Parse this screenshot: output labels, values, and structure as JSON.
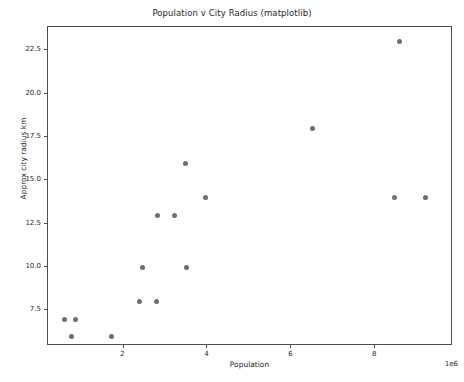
{
  "figure": {
    "title": "Population v City Radius (matplotlib)",
    "background": "#ffffff",
    "frame_color": "#4d4d4d",
    "marker_color": "#6e6e6e"
  },
  "axes": {
    "x_label": "Population",
    "y_label": "Approx city radius km",
    "x_offset_text": "1e6",
    "x_ticks": [
      "2",
      "4",
      "6",
      "8"
    ],
    "y_ticks": [
      "7.5",
      "10.0",
      "12.5",
      "15.0",
      "17.5",
      "20.0",
      "22.5"
    ]
  },
  "chart_data": {
    "type": "scatter",
    "title": "Population v City Radius (matplotlib)",
    "xlabel": "Population",
    "ylabel": "Approx city radius km",
    "x_offset": "1e6",
    "xlim": [
      200000,
      9850000
    ],
    "ylim": [
      5.45,
      23.85
    ],
    "xticks": [
      2000000,
      4000000,
      6000000,
      8000000
    ],
    "xticklabels": [
      "2",
      "4",
      "6",
      "8"
    ],
    "yticks": [
      7.5,
      10.0,
      12.5,
      15.0,
      17.5,
      20.0,
      22.5
    ],
    "yticklabels": [
      "7.5",
      "10.0",
      "12.5",
      "15.0",
      "17.5",
      "20.0",
      "22.5"
    ],
    "grid": false,
    "legend": null,
    "marker": "circle",
    "marker_color": "#6e6e6e",
    "marker_size": 5,
    "series": [
      {
        "name": "cities",
        "points": [
          {
            "x": 600000,
            "y": 7
          },
          {
            "x": 860000,
            "y": 7
          },
          {
            "x": 750000,
            "y": 6
          },
          {
            "x": 1720000,
            "y": 6
          },
          {
            "x": 2380000,
            "y": 8
          },
          {
            "x": 2790000,
            "y": 8
          },
          {
            "x": 2450000,
            "y": 10
          },
          {
            "x": 3500000,
            "y": 10
          },
          {
            "x": 2810000,
            "y": 13
          },
          {
            "x": 3220000,
            "y": 13
          },
          {
            "x": 3480000,
            "y": 16
          },
          {
            "x": 3950000,
            "y": 14
          },
          {
            "x": 6500000,
            "y": 18
          },
          {
            "x": 8580000,
            "y": 23
          },
          {
            "x": 8460000,
            "y": 14
          },
          {
            "x": 9200000,
            "y": 14
          }
        ]
      }
    ]
  }
}
